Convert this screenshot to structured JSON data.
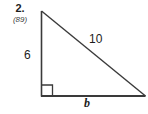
{
  "problem": {
    "number": "2.",
    "page_reference": "(89)"
  },
  "figure": {
    "type": "right-triangle",
    "labels": {
      "vertical_leg": "6",
      "hypotenuse": "10",
      "horizontal_leg": "b"
    },
    "right_angle_marker": true,
    "stroke_color": "#3a3a3a",
    "background_color": "#ffffff",
    "vertices": {
      "apex": [
        41,
        11
      ],
      "bottom_left": [
        41,
        96
      ],
      "bottom_right": [
        145,
        96
      ]
    },
    "right_angle_square": {
      "x": 41,
      "y": 85,
      "size": 11
    }
  }
}
